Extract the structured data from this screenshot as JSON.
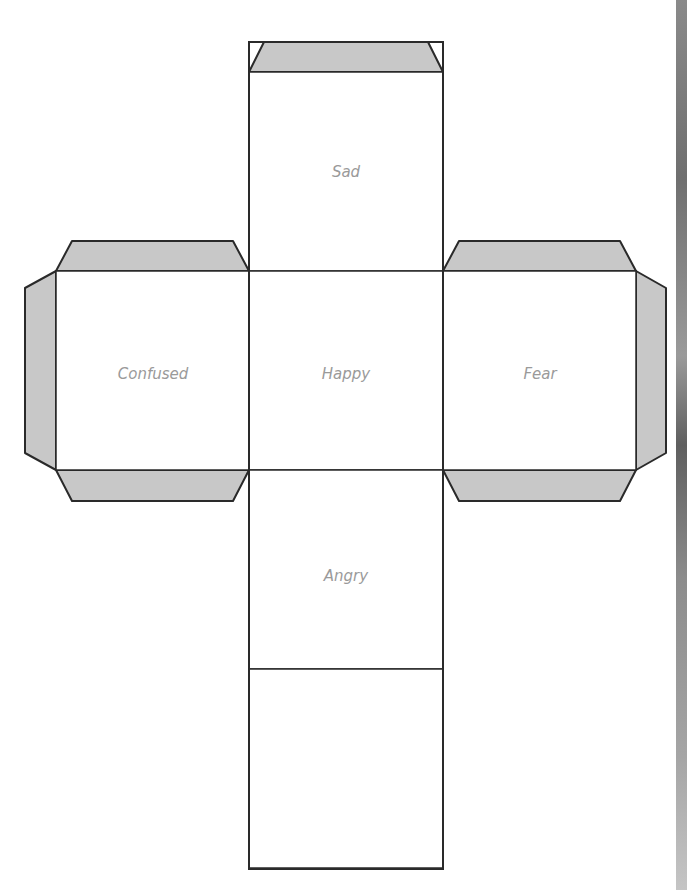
{
  "faces": {
    "top": "Sad",
    "left": "Confused",
    "center": "Happy",
    "right": "Fear",
    "bottom": "Angry",
    "back": ""
  },
  "colors": {
    "flap": "#c8c8c8",
    "outline": "#2a2a2a",
    "label": "#9a9a9a",
    "face": "#ffffff"
  }
}
